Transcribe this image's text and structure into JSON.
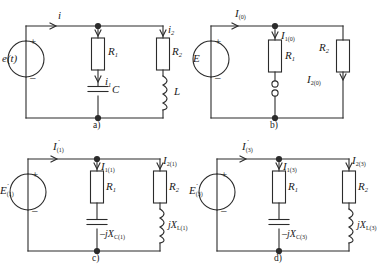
{
  "figure": {
    "type": "electrical-circuit-diagram",
    "panel_count": 4,
    "stroke_color": "#2b2b2b",
    "background": "#ffffff"
  },
  "panels": [
    {
      "caption": "a)",
      "source": {
        "label": "e(t)",
        "plus": "+",
        "minus": "–",
        "kind": "ac-voltage-source"
      },
      "currents": [
        {
          "name": "i",
          "text": "i",
          "sub": ""
        },
        {
          "name": "i1",
          "text": "i",
          "sub": "1"
        },
        {
          "name": "i2",
          "text": "i",
          "sub": "2"
        }
      ],
      "components": [
        {
          "name": "R1",
          "text": "R",
          "sub": "1",
          "kind": "resistor"
        },
        {
          "name": "R2",
          "text": "R",
          "sub": "2",
          "kind": "resistor"
        },
        {
          "name": "C",
          "text": "C",
          "sub": "",
          "kind": "capacitor"
        },
        {
          "name": "L",
          "text": "L",
          "sub": "",
          "kind": "inductor"
        }
      ]
    },
    {
      "caption": "b)",
      "source": {
        "label": "E",
        "plus": "+",
        "minus": "–",
        "kind": "dc-voltage-source"
      },
      "currents": [
        {
          "name": "I0",
          "text": "I",
          "sub": "(0)"
        },
        {
          "name": "I1_0",
          "text": "I",
          "sub": "1(0)"
        },
        {
          "name": "I2_0",
          "text": "I",
          "sub": "2(0)"
        }
      ],
      "components": [
        {
          "name": "R1",
          "text": "R",
          "sub": "1",
          "kind": "resistor"
        },
        {
          "name": "R2",
          "text": "R",
          "sub": "2",
          "kind": "resistor"
        },
        {
          "name": "switch",
          "text": "",
          "sub": "",
          "kind": "open-switch"
        }
      ]
    },
    {
      "caption": "c)",
      "source": {
        "label": "E",
        "sub": "(1)",
        "plus": "+",
        "minus": "–",
        "kind": "phasor-voltage-source",
        "accent": "dot"
      },
      "currents": [
        {
          "name": "I1",
          "text": "I",
          "sub": "(1)"
        },
        {
          "name": "I1_1",
          "text": "I",
          "sub": "1(1)"
        },
        {
          "name": "I2_1",
          "text": "I",
          "sub": "2(1)"
        }
      ],
      "components": [
        {
          "name": "R1",
          "text": "R",
          "sub": "1",
          "kind": "resistor"
        },
        {
          "name": "R2",
          "text": "R",
          "sub": "2",
          "kind": "resistor"
        },
        {
          "name": "XC",
          "text": "–jX",
          "sub": "C(1)",
          "kind": "capacitor"
        },
        {
          "name": "XL",
          "text": "jX",
          "sub": "L(1)",
          "kind": "inductor"
        }
      ]
    },
    {
      "caption": "d)",
      "source": {
        "label": "E",
        "sub": "(3)",
        "plus": "+",
        "minus": "–",
        "kind": "phasor-voltage-source",
        "accent": "dot"
      },
      "currents": [
        {
          "name": "I3",
          "text": "I",
          "sub": "(3)"
        },
        {
          "name": "I1_3",
          "text": "I",
          "sub": "1(3)"
        },
        {
          "name": "I2_3",
          "text": "I",
          "sub": "2(3)"
        }
      ],
      "components": [
        {
          "name": "R1",
          "text": "R",
          "sub": "1",
          "kind": "resistor"
        },
        {
          "name": "R2",
          "text": "R",
          "sub": "2",
          "kind": "resistor"
        },
        {
          "name": "XC",
          "text": "–jX",
          "sub": "C(3)",
          "kind": "capacitor"
        },
        {
          "name": "XL",
          "text": "jX",
          "sub": "L(3)",
          "kind": "inductor"
        }
      ]
    }
  ]
}
